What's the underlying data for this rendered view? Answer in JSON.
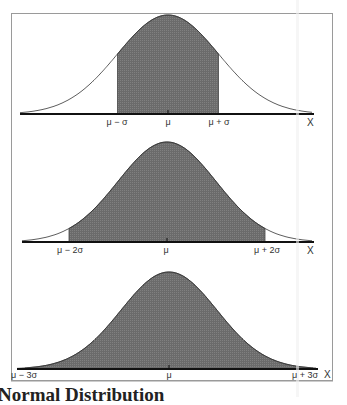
{
  "chart_data": [
    {
      "type": "area",
      "title": "",
      "xlabel": "X",
      "ylabel": "",
      "distribution": "normal",
      "shaded_region": {
        "from_sigma": -1,
        "to_sigma": 1
      },
      "tick_labels": [
        "μ − σ",
        "μ",
        "μ + σ"
      ],
      "axis_label": "X"
    },
    {
      "type": "area",
      "title": "",
      "xlabel": "X",
      "ylabel": "",
      "distribution": "normal",
      "shaded_region": {
        "from_sigma": -2,
        "to_sigma": 2
      },
      "tick_labels": [
        "μ − 2σ",
        "μ",
        "μ + 2σ"
      ],
      "axis_label": "X"
    },
    {
      "type": "area",
      "title": "",
      "xlabel": "X",
      "ylabel": "",
      "distribution": "normal",
      "shaded_region": {
        "from_sigma": -3,
        "to_sigma": 3
      },
      "tick_labels": [
        "μ − 3σ",
        "μ",
        "μ + 3σ"
      ],
      "axis_label": "X"
    }
  ],
  "panels": [
    {
      "labels": {
        "left": "μ − σ",
        "center": "μ",
        "right": "μ + σ"
      },
      "axis": "X"
    },
    {
      "labels": {
        "left": "μ − 2σ",
        "center": "μ",
        "right": "μ + 2σ"
      },
      "axis": "X"
    },
    {
      "labels": {
        "left": "μ − 3σ",
        "center": "μ",
        "right": "μ + 3σ"
      },
      "axis": "X"
    }
  ],
  "caption": "Normal Distribution",
  "colors": {
    "shade": "#6e6e6e",
    "curve": "#333333",
    "frame": "#999999"
  }
}
